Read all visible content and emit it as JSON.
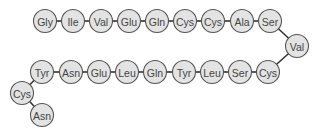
{
  "diagram": {
    "title": "",
    "circle_radius": 11.5,
    "colors": {
      "fill": "#e3e3e3",
      "stroke": "#555555",
      "text": "#444444",
      "bond": "#333333"
    },
    "residues": [
      {
        "label": "Gly",
        "x": 45,
        "y": 21
      },
      {
        "label": "Ile",
        "x": 73,
        "y": 21
      },
      {
        "label": "Val",
        "x": 101,
        "y": 21
      },
      {
        "label": "Glu",
        "x": 129,
        "y": 21
      },
      {
        "label": "Gln",
        "x": 157,
        "y": 21
      },
      {
        "label": "Cys",
        "x": 185,
        "y": 21
      },
      {
        "label": "Cys",
        "x": 213,
        "y": 21
      },
      {
        "label": "Ala",
        "x": 242,
        "y": 21
      },
      {
        "label": "Ser",
        "x": 270,
        "y": 21
      },
      {
        "label": "Val",
        "x": 297,
        "y": 46
      },
      {
        "label": "Cys",
        "x": 268,
        "y": 72
      },
      {
        "label": "Ser",
        "x": 240,
        "y": 72
      },
      {
        "label": "Leu",
        "x": 212,
        "y": 72
      },
      {
        "label": "Tyr",
        "x": 184,
        "y": 72
      },
      {
        "label": "Gln",
        "x": 155,
        "y": 72
      },
      {
        "label": "Leu",
        "x": 127,
        "y": 72
      },
      {
        "label": "Glu",
        "x": 99,
        "y": 72
      },
      {
        "label": "Asn",
        "x": 71,
        "y": 72
      },
      {
        "label": "Tyr",
        "x": 42,
        "y": 72
      },
      {
        "label": "Cys",
        "x": 22,
        "y": 93
      },
      {
        "label": "Asn",
        "x": 42,
        "y": 115
      }
    ]
  }
}
